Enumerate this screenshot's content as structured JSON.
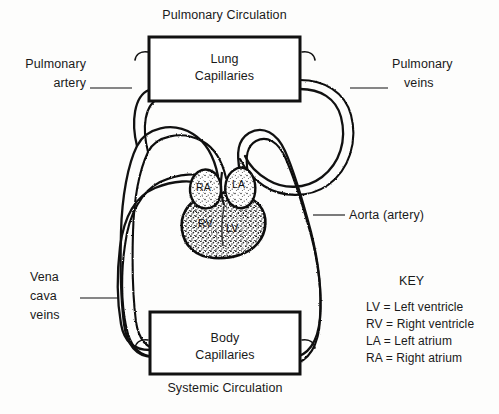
{
  "figure": {
    "type": "biology-diagram",
    "background_color": "#fdfdfc",
    "ink_color": "#111111"
  },
  "titles": {
    "top": "Pulmonary Circulation",
    "bottom": "Systemic Circulation"
  },
  "boxes": {
    "lung": {
      "line1": "Lung",
      "line2": "Capillaries"
    },
    "body": {
      "line1": "Body",
      "line2": "Capillaries"
    }
  },
  "vessel_labels": {
    "pulmonary_artery": {
      "line1": "Pulmonary",
      "line2": "artery"
    },
    "pulmonary_veins": {
      "line1": "Pulmonary",
      "line2": "veins"
    },
    "vena_cava": {
      "line1": "Vena",
      "line2": "cava",
      "line3": "veins"
    },
    "aorta": "Aorta (artery)"
  },
  "heart_chambers": [
    {
      "abbr": "RA",
      "name": "Right atrium"
    },
    {
      "abbr": "LA",
      "name": "Left atrium"
    },
    {
      "abbr": "RV",
      "name": "Right ventricle"
    },
    {
      "abbr": "LV",
      "name": "Left ventricle"
    }
  ],
  "key": {
    "heading": "KEY",
    "entries": [
      "LV = Left ventricle",
      "RV = Right ventricle",
      "LA = Left atrium",
      "RA = Right atrium"
    ]
  }
}
